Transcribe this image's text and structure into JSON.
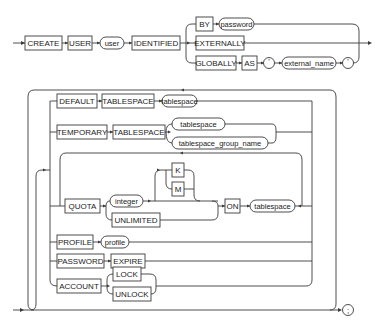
{
  "diagram": {
    "type": "railroad-syntax-diagram",
    "statement": "CREATE USER",
    "top": {
      "create": "CREATE",
      "user_kw": "USER",
      "user_var": "user",
      "identified": "IDENTIFIED",
      "by": "BY",
      "password_var": "password",
      "externally": "EXTERNALLY",
      "globally": "GLOBALLY",
      "as": "AS",
      "quote_open": "'",
      "external_name_var": "external_name",
      "quote_close": "'"
    },
    "options": {
      "default": "DEFAULT",
      "default_tablespace_kw": "TABLESPACE",
      "default_tablespace_var": "tablespace",
      "temporary": "TEMPORARY",
      "temporary_tablespace_kw": "TABLESPACE",
      "temporary_tablespace_var": "tablespace",
      "tablespace_group_name_var": "tablespace_group_name",
      "quota": "QUOTA",
      "integer_var": "integer",
      "k": "K",
      "m": "M",
      "unlimited": "UNLIMITED",
      "on": "ON",
      "quota_tablespace_var": "tablespace",
      "profile_kw": "PROFILE",
      "profile_var": "profile",
      "password_kw": "PASSWORD",
      "expire": "EXPIRE",
      "account": "ACCOUNT",
      "lock": "LOCK",
      "unlock": "UNLOCK"
    },
    "terminator": ";"
  }
}
